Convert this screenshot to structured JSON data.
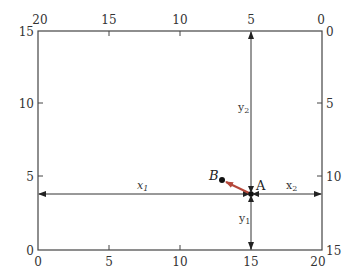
{
  "diagram": {
    "type": "coordinate-box-with-two-origins",
    "box": {
      "x_range": [
        0,
        20
      ],
      "y_range": [
        0,
        15
      ]
    },
    "bottom_axis_ticks": [
      "0",
      "5",
      "10",
      "15",
      "20"
    ],
    "top_axis_ticks": [
      "20",
      "15",
      "10",
      "5",
      "0"
    ],
    "left_axis_ticks": [
      "0",
      "5",
      "10",
      "15"
    ],
    "right_axis_ticks": [
      "15",
      "10",
      "5",
      "0"
    ],
    "points": {
      "A": {
        "label": "A",
        "x": 15,
        "y": 4
      },
      "B": {
        "label": "B",
        "x": 13,
        "y": 5
      }
    },
    "distances": {
      "x1": {
        "label": "x",
        "sub": "1"
      },
      "x2": {
        "label": "x",
        "sub": "2"
      },
      "y1": {
        "label": "y",
        "sub": "1"
      },
      "y2": {
        "label": "y",
        "sub": "2"
      }
    },
    "colors": {
      "line": "#333333",
      "arrow_AB": "#b5473a",
      "point": "#111111"
    }
  }
}
